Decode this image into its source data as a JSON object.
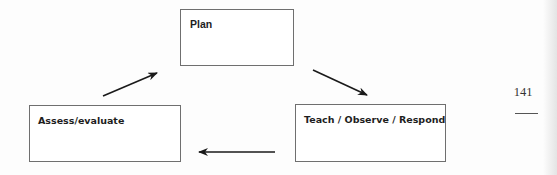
{
  "diagram": {
    "type": "cycle",
    "nodes": [
      {
        "id": "plan",
        "label": "Plan"
      },
      {
        "id": "teach",
        "label": "Teach / Observe / Respond"
      },
      {
        "id": "assess",
        "label": "Assess/evaluate"
      }
    ],
    "edges": [
      {
        "from": "plan",
        "to": "teach"
      },
      {
        "from": "teach",
        "to": "assess"
      },
      {
        "from": "assess",
        "to": "plan"
      }
    ]
  },
  "page": {
    "number": "141"
  },
  "colors": {
    "box_border": "#6f6f6f",
    "arrow": "#1a1a1a",
    "text": "#1e1e1e"
  }
}
